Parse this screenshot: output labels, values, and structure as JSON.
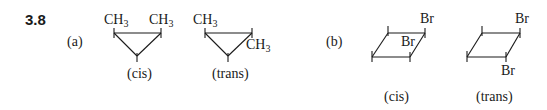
{
  "problem_number": "3.8",
  "parts": [
    {
      "label": "(a)",
      "compound": "1,2-dimethylcyclopropane",
      "isomers": [
        {
          "caption": "(cis)",
          "substituents": [
            "CH3",
            "CH3"
          ],
          "sub_a": "CH",
          "sub_a_num": "3",
          "sub_b": "CH",
          "sub_b_num": "3"
        },
        {
          "caption": "(trans)",
          "substituents": [
            "CH3",
            "CH3"
          ],
          "sub_a": "CH",
          "sub_a_num": "3",
          "sub_b": "CH",
          "sub_b_num": "3"
        }
      ]
    },
    {
      "label": "(b)",
      "compound": "1,2-dibromocyclobutane",
      "isomers": [
        {
          "caption": "(cis)",
          "substituents": [
            "Br",
            "Br"
          ],
          "sub_a": "Br",
          "sub_b": "Br"
        },
        {
          "caption": "(trans)",
          "substituents": [
            "Br",
            "Br"
          ],
          "sub_a": "Br",
          "sub_b": "Br"
        }
      ]
    }
  ]
}
